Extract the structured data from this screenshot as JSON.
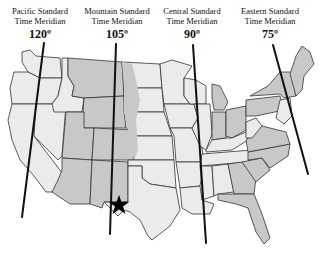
{
  "map": {
    "title": "U.S. Standard Time Meridians",
    "meridians": [
      {
        "id": "pacific",
        "line1": "Pacific Standard",
        "line2": "Time Meridian",
        "degree": "120º"
      },
      {
        "id": "mountain",
        "line1": "Mountain Standard",
        "line2": "Time Meridian",
        "degree": "105º"
      },
      {
        "id": "central",
        "line1": "Central Standard",
        "line2": "Time Meridian",
        "degree": "90º"
      },
      {
        "id": "eastern",
        "line1": "Eastern Standard",
        "line2": "Time Meridian",
        "degree": "75º"
      }
    ],
    "marker": {
      "type": "star",
      "location": "El Paso, Texas region"
    },
    "colors": {
      "light_state": "#ebebeb",
      "dark_state": "#c8c8c8",
      "border": "#333333",
      "meridian": "#111111"
    }
  }
}
